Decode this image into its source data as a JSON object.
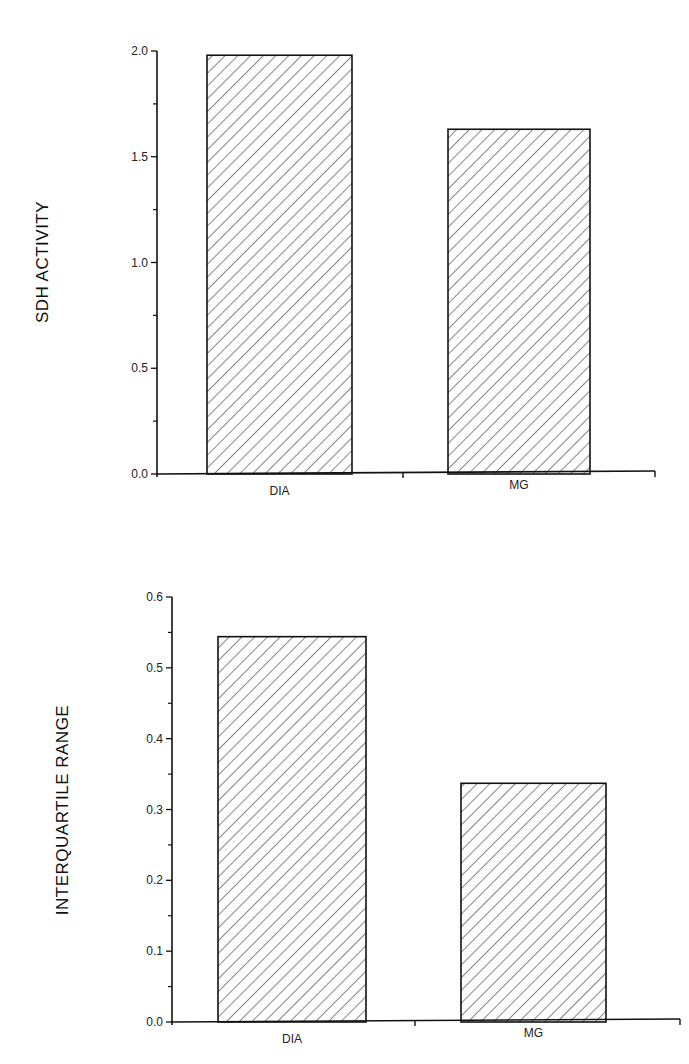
{
  "chart_data": [
    {
      "type": "bar",
      "title": "",
      "xlabel": "",
      "ylabel": "SDH ACTIVITY",
      "categories": [
        "DIA",
        "MG"
      ],
      "values": [
        1.98,
        1.63
      ],
      "ylim": [
        0,
        2.0
      ],
      "yticks": [
        "0.0",
        "0.5",
        "1.0",
        "1.5",
        "2.0"
      ],
      "minor_tick_step": 0.25,
      "grid": false,
      "legend": null,
      "bar_fill": "diagonal-hatch"
    },
    {
      "type": "bar",
      "title": "",
      "xlabel": "",
      "ylabel": "INTERQUARTILE RANGE",
      "categories": [
        "DIA",
        "MG"
      ],
      "values": [
        0.544,
        0.337
      ],
      "ylim": [
        0,
        0.6
      ],
      "yticks": [
        "0.0",
        "0.1",
        "0.2",
        "0.3",
        "0.4",
        "0.5",
        "0.6"
      ],
      "minor_tick_step": 0.05,
      "grid": false,
      "legend": null,
      "bar_fill": "diagonal-hatch"
    }
  ],
  "colors": {
    "ink": "#111111",
    "background": "#ffffff"
  }
}
